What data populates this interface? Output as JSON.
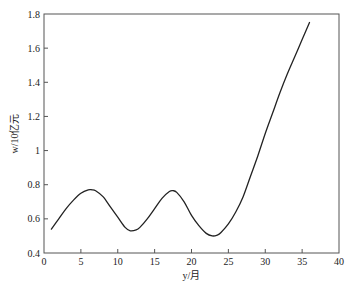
{
  "chart_data": {
    "type": "line",
    "title": "",
    "xlabel": "y/月",
    "ylabel": "w/10亿元",
    "xlim": [
      0,
      40
    ],
    "ylim": [
      0.4,
      1.8
    ],
    "xticks": [
      0,
      5,
      10,
      15,
      20,
      25,
      30,
      35,
      40
    ],
    "yticks": [
      0.4,
      0.6,
      0.8,
      1,
      1.2,
      1.4,
      1.6,
      1.8
    ],
    "xtick_labels": [
      "0",
      "5",
      "10",
      "15",
      "20",
      "25",
      "30",
      "35",
      "40"
    ],
    "ytick_labels": [
      "0.4",
      "0.6",
      "0.8",
      "1",
      "1.2",
      "1.4",
      "1.6",
      "1.8"
    ],
    "grid": false,
    "legend": null,
    "series": [
      {
        "name": "w",
        "x": [
          1,
          2,
          3,
          4,
          5,
          6,
          6.5,
          7,
          8,
          9,
          10,
          11,
          11.7,
          12.5,
          13,
          14,
          15,
          16,
          17,
          17.5,
          18,
          19,
          20,
          21,
          22,
          22.8,
          23.5,
          24,
          25,
          26,
          27,
          28,
          29,
          30,
          31,
          32,
          33,
          34,
          35,
          36
        ],
        "y": [
          0.54,
          0.6,
          0.66,
          0.71,
          0.75,
          0.77,
          0.77,
          0.765,
          0.73,
          0.67,
          0.61,
          0.55,
          0.53,
          0.535,
          0.55,
          0.6,
          0.66,
          0.72,
          0.76,
          0.765,
          0.755,
          0.7,
          0.62,
          0.56,
          0.515,
          0.5,
          0.505,
          0.52,
          0.57,
          0.64,
          0.73,
          0.85,
          0.97,
          1.1,
          1.22,
          1.34,
          1.45,
          1.55,
          1.65,
          1.75
        ]
      }
    ]
  }
}
